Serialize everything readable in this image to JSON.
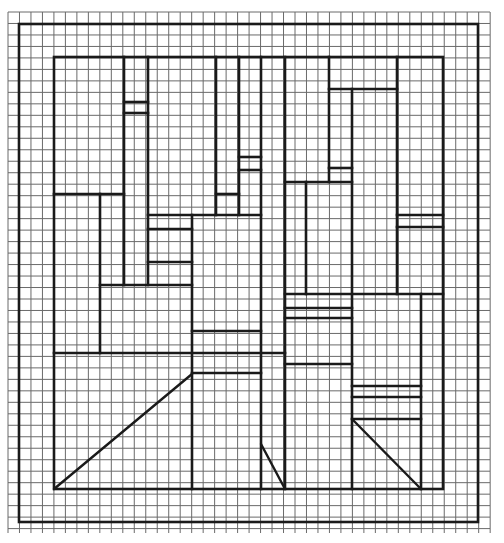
{
  "figure": {
    "colors": {
      "background": "#ffffff",
      "grid": "#6a6a6a",
      "ink": "#1a1a1a"
    },
    "grid": {
      "x0": 8,
      "y0": 12,
      "x1": 490,
      "y1": 533,
      "step": 11.48
    },
    "outer_frame": {
      "x": 19,
      "y": 24,
      "w": 459,
      "h": 498
    },
    "inner_frame": {
      "x": 54,
      "y": 57,
      "w": 389,
      "h": 432
    },
    "horizontal_segments": [
      [
        124,
        102,
        148
      ],
      [
        124,
        113,
        148
      ],
      [
        54,
        194,
        124
      ],
      [
        216,
        194,
        239
      ],
      [
        239,
        157,
        261
      ],
      [
        239,
        170,
        261
      ],
      [
        148,
        215,
        261
      ],
      [
        148,
        229,
        192
      ],
      [
        148,
        262,
        192
      ],
      [
        100,
        285,
        192
      ],
      [
        192,
        331,
        261
      ],
      [
        54,
        353,
        285
      ],
      [
        192,
        373,
        261
      ],
      [
        329,
        89,
        397
      ],
      [
        329,
        168,
        352
      ],
      [
        285,
        182,
        352
      ],
      [
        397,
        215,
        443
      ],
      [
        397,
        227,
        443
      ],
      [
        285,
        294,
        443
      ],
      [
        285,
        308,
        352
      ],
      [
        285,
        318,
        352
      ],
      [
        285,
        364,
        352
      ],
      [
        352,
        386,
        421
      ],
      [
        352,
        397,
        421
      ],
      [
        352,
        419,
        421
      ]
    ],
    "vertical_segments": [
      [
        124,
        57,
        285
      ],
      [
        148,
        57,
        285
      ],
      [
        216,
        57,
        215
      ],
      [
        239,
        57,
        215
      ],
      [
        261,
        57,
        489
      ],
      [
        285,
        57,
        489
      ],
      [
        100,
        194,
        353
      ],
      [
        192,
        215,
        489
      ],
      [
        329,
        57,
        182
      ],
      [
        352,
        89,
        489
      ],
      [
        306,
        182,
        294
      ],
      [
        397,
        57,
        294
      ],
      [
        421,
        294,
        489
      ]
    ],
    "diagonal_segments": [
      [
        54,
        489,
        192,
        374
      ],
      [
        261,
        444,
        285,
        489
      ],
      [
        352,
        419,
        421,
        489
      ]
    ]
  }
}
